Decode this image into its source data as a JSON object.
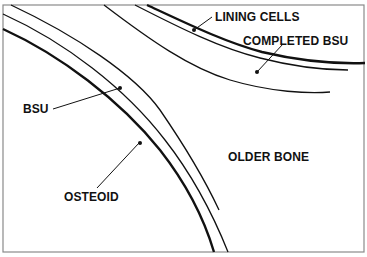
{
  "diagram": {
    "labels": {
      "lining_cells": "LINING CELLS",
      "completed_bsu": "COMPLETED BSU",
      "bsu": "BSU",
      "older_bone": "OLDER BONE",
      "osteoid": "OSTEOID"
    },
    "colors": {
      "stroke": "#111111",
      "frame": "#888888",
      "background": "#ffffff"
    }
  }
}
